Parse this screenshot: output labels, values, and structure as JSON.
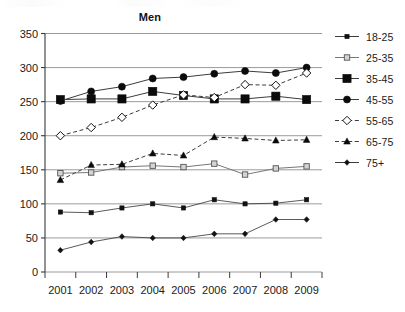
{
  "chart_data": {
    "type": "line",
    "title": "Men",
    "xlabel": "",
    "ylabel": "",
    "categories": [
      "2001",
      "2002",
      "2003",
      "2004",
      "2005",
      "2006",
      "2007",
      "2008",
      "2009"
    ],
    "ylim": [
      0,
      350
    ],
    "yticks": [
      0,
      50,
      100,
      150,
      200,
      250,
      300,
      350
    ],
    "ytick_labels": [
      "0",
      "50",
      "100",
      "150",
      "200",
      "250",
      "300",
      "350"
    ],
    "grid": true,
    "legend_position": "right",
    "series": [
      {
        "name": "18-25",
        "marker": "small-filled-square",
        "line": "solid",
        "values": [
          88,
          87,
          94,
          100,
          94,
          106,
          100,
          101,
          106
        ]
      },
      {
        "name": "25-35",
        "marker": "open-square",
        "line": "solid",
        "values": [
          145,
          146,
          154,
          156,
          154,
          159,
          143,
          152,
          155
        ]
      },
      {
        "name": "35-45",
        "marker": "large-filled-square",
        "line": "solid",
        "values": [
          253,
          254,
          254,
          265,
          259,
          254,
          254,
          258,
          253
        ]
      },
      {
        "name": "45-55",
        "marker": "filled-circle",
        "line": "solid",
        "values": [
          251,
          265,
          272,
          284,
          286,
          291,
          295,
          292,
          300
        ]
      },
      {
        "name": "55-65",
        "marker": "open-diamond",
        "line": "dashed",
        "values": [
          200,
          212,
          227,
          245,
          260,
          256,
          275,
          274,
          292
        ]
      },
      {
        "name": "65-75",
        "marker": "filled-triangle",
        "line": "dashed",
        "values": [
          135,
          157,
          158,
          174,
          171,
          198,
          196,
          193,
          194
        ]
      },
      {
        "name": "75+",
        "marker": "small-diamond",
        "line": "solid",
        "values": [
          32,
          44,
          52,
          50,
          50,
          56,
          56,
          77,
          77
        ]
      }
    ]
  },
  "legend": {
    "items": [
      {
        "label": "18-25"
      },
      {
        "label": "25-35"
      },
      {
        "label": "35-45"
      },
      {
        "label": "45-55"
      },
      {
        "label": "55-65"
      },
      {
        "label": "65-75"
      },
      {
        "label": "75+"
      }
    ]
  }
}
